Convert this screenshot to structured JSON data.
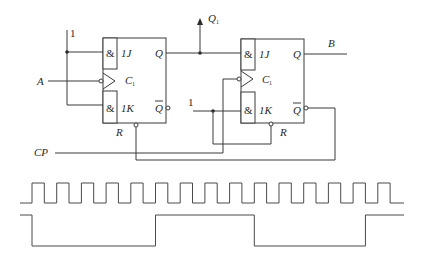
{
  "diagram": {
    "type": "JK flip-flop circuit with timing waveforms",
    "labels": {
      "one_left": "1",
      "input_a": "A",
      "cp": "CP",
      "q1": "Q",
      "q1_sub": "1",
      "b": "B",
      "one_right": "1"
    },
    "flipflops": [
      {
        "id": "ff1",
        "and_j": "&",
        "j": "1J",
        "clock": "C",
        "clock_sub": "1",
        "and_k": "&",
        "k": "1K",
        "q": "Q",
        "qbar": "Q",
        "reset": "R"
      },
      {
        "id": "ff2",
        "and_j": "&",
        "j": "1J",
        "clock": "C",
        "clock_sub": "1",
        "and_k": "&",
        "k": "1K",
        "q": "Q",
        "qbar": "Q",
        "reset": "R"
      }
    ],
    "waveforms": {
      "clock_pulses": 15,
      "output_levels": [
        {
          "level": "high",
          "from_pulse": 0,
          "to_pulse": 0
        },
        {
          "level": "low",
          "from_pulse": 0,
          "to_pulse": 5
        },
        {
          "level": "high",
          "from_pulse": 5,
          "to_pulse": 9
        },
        {
          "level": "low",
          "from_pulse": 9,
          "to_pulse": 13.5
        },
        {
          "level": "high",
          "from_pulse": 13.5,
          "to_pulse": 15
        }
      ]
    }
  }
}
